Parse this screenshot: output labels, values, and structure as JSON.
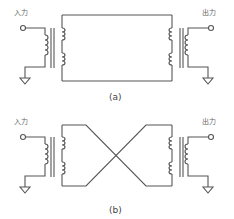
{
  "panels": [
    {
      "id": "a",
      "caption": "(a)",
      "input_label": "入力",
      "output_label": "出力",
      "connection": "straight"
    },
    {
      "id": "b",
      "caption": "(b)",
      "input_label": "入力",
      "output_label": "出力",
      "connection": "crossed"
    }
  ],
  "colors": {
    "line": "#555555",
    "text": "#555555"
  }
}
